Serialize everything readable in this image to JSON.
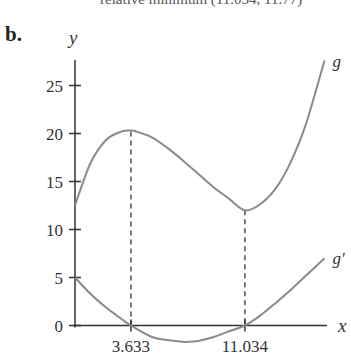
{
  "header": {
    "cutoff_text": "relative minimum (11.034, 11.77)",
    "part_label": "b."
  },
  "chart_data": {
    "type": "line",
    "title": "",
    "xlabel": "x",
    "ylabel": "y",
    "xlim": [
      0,
      16.5
    ],
    "ylim": [
      -2,
      27.5
    ],
    "grid": false,
    "y_ticks": [
      0,
      5,
      10,
      15,
      20,
      25
    ],
    "y_tick_labels": [
      "0",
      "5",
      "10",
      "15",
      "20",
      "25"
    ],
    "x_ticks": [
      3.633,
      11.034
    ],
    "x_tick_labels": [
      "3.633",
      "11.034"
    ],
    "series": [
      {
        "name": "g",
        "label": "g",
        "x": [
          0,
          1,
          2,
          3,
          3.633,
          4,
          5,
          6,
          7,
          8,
          9,
          10,
          11.034,
          12,
          13,
          14,
          15,
          16.2
        ],
        "y": [
          12.5,
          16.9,
          19.3,
          20.2,
          20.3,
          20.2,
          19.6,
          18.5,
          17.2,
          15.8,
          14.4,
          13.2,
          12.0,
          12.6,
          14.2,
          17.0,
          21.0,
          27.6
        ]
      },
      {
        "name": "g'",
        "label": "g'",
        "x": [
          0,
          1,
          2,
          3,
          3.633,
          5,
          6,
          7,
          7.33,
          8,
          9,
          10,
          11.034,
          12,
          13,
          14,
          15,
          16.2
        ],
        "y": [
          5.0,
          3.3,
          1.9,
          0.7,
          0,
          -1.2,
          -1.5,
          -1.7,
          -1.7,
          -1.6,
          -1.2,
          -0.6,
          0,
          1.0,
          2.3,
          3.7,
          5.2,
          7.0
        ]
      }
    ],
    "guides": [
      {
        "x": 3.633,
        "from": 0,
        "to": 20.2,
        "style": "dashed"
      },
      {
        "x": 11.034,
        "from": 0,
        "to": 12.0,
        "style": "dashed"
      }
    ],
    "colors": {
      "curve": "#8a8a8a",
      "axis": "#333333"
    }
  }
}
